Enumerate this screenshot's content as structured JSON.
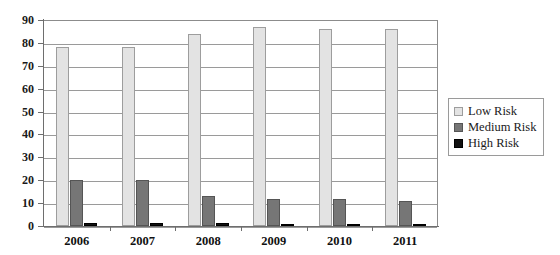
{
  "chart_data": {
    "type": "bar",
    "title": "",
    "subtitle": "",
    "xlabel": "",
    "ylabel": "",
    "categories": [
      "2006",
      "2007",
      "2008",
      "2009",
      "2010",
      "2011"
    ],
    "series": [
      {
        "name": "Low Risk",
        "color": "#e3e3e3",
        "values": [
          78,
          78,
          84,
          87,
          86,
          86
        ]
      },
      {
        "name": "Medium Risk",
        "color": "#767676",
        "values": [
          20,
          20,
          13,
          12,
          12,
          11
        ]
      },
      {
        "name": "High Risk",
        "color": "#111111",
        "values": [
          1.5,
          1.5,
          1.2,
          1,
          1,
          0.8
        ]
      }
    ],
    "ylim": [
      0,
      90
    ],
    "yticks": [
      0,
      10,
      20,
      30,
      40,
      50,
      60,
      70,
      80,
      90
    ],
    "ytick_labels": [
      "0",
      "10",
      "20",
      "30",
      "40",
      "50",
      "60",
      "70",
      "80",
      "90"
    ],
    "grid": true,
    "grid_axis": "y",
    "legend_position": "right",
    "legend": [
      "Low Risk",
      "Medium Risk",
      "High Risk"
    ]
  },
  "axes": {
    "y_tick_labels": [
      "90",
      "80",
      "70",
      "60",
      "50",
      "40",
      "30",
      "20",
      "10",
      "0"
    ],
    "x_tick_labels": [
      "2006",
      "2007",
      "2008",
      "2009",
      "2010",
      "2011"
    ]
  },
  "legend": {
    "items": [
      {
        "label": "Low Risk",
        "swatch": "legend-swatch-low-risk"
      },
      {
        "label": "Medium Risk",
        "swatch": "legend-swatch-medium-risk"
      },
      {
        "label": "High Risk",
        "swatch": "legend-swatch-high-risk"
      }
    ]
  }
}
